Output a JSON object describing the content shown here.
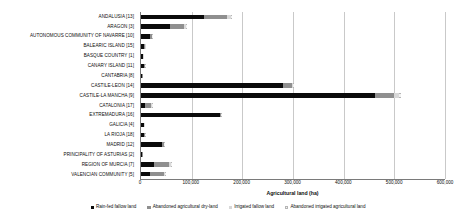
{
  "chart_data": {
    "type": "bar",
    "orientation": "horizontal",
    "stacked": true,
    "title": "",
    "xlabel": "Agricultural land (ha)",
    "ylabel": "",
    "xlim": [
      0,
      600000
    ],
    "xticks": [
      0,
      100000,
      200000,
      300000,
      400000,
      500000,
      600000
    ],
    "xticklabels": [
      "0",
      "100,000",
      "200,000",
      "300,000",
      "400,000",
      "500,000",
      "600,000"
    ],
    "grid": "vertical",
    "legend_position": "bottom",
    "categories": [
      "ANDALUSIA [13]",
      "ARAGON [3]",
      "AUTONOMOUS COMMUNITY OF NAVARRE [10]",
      "BALEARIC ISLAND [15]",
      "BASQUE COUNTRY [1]",
      "CANARY ISLAND [11]",
      "CANTABRIA [8]",
      "CASTILE-LEON [14]",
      "CASTILE-LA MANCHA [9]",
      "CATALONIA [17]",
      "EXTREMADURA [16]",
      "GALICIA [4]",
      "LA RIOJA [18]",
      "MADRID [12]",
      "PRINCIPALITY OF ASTURIAS [2]",
      "REGION OF MURCIA [7]",
      "VALENCIAN COMMUNITY [5]"
    ],
    "series": [
      {
        "name": "Rain-fed fallow land",
        "color": "#0a0a0a",
        "values": [
          124000,
          57000,
          17000,
          6500,
          3000,
          6000,
          1500,
          280000,
          462000,
          7000,
          155000,
          5000,
          5500,
          41000,
          1200,
          25000,
          17000
        ]
      },
      {
        "name": "Abandoned agricultural dry-land",
        "color": "#8f8f8f",
        "values": [
          45000,
          28000,
          4000,
          1000,
          500,
          1500,
          600,
          18000,
          38000,
          13000,
          2500,
          1500,
          1500,
          4000,
          600,
          30000,
          28000
        ]
      },
      {
        "name": "Irrigated fallow land",
        "color": "#d8d8d8",
        "values": [
          8000,
          4000,
          1000,
          300,
          200,
          500,
          100,
          3000,
          9000,
          2000,
          1000,
          300,
          400,
          800,
          100,
          4000,
          3000
        ]
      },
      {
        "name": "Abandoned irrigated agricultural land",
        "color": "#f2f2f2",
        "values": [
          3000,
          1500,
          400,
          150,
          100,
          300,
          80,
          1500,
          4000,
          800,
          500,
          150,
          200,
          400,
          60,
          1500,
          1200
        ]
      }
    ]
  },
  "legend": {
    "items": [
      "Rain-fed fallow land",
      "Abandoned agricultural dry-land",
      "Irrigated fallow land",
      "Abandoned irrigated agricultural land"
    ]
  }
}
